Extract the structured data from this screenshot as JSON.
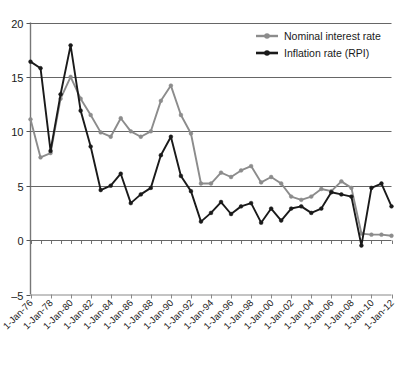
{
  "chart_data": {
    "type": "line",
    "title": "",
    "subtitle": "",
    "xlabel": "",
    "ylabel": "",
    "ylim": [
      -5,
      20
    ],
    "yticks": [
      -5,
      0,
      5,
      10,
      15,
      20
    ],
    "ytick_labels": [
      "–5",
      "0",
      "5",
      "10",
      "15",
      "20"
    ],
    "grid": "horizontal",
    "legend_position": "top-right",
    "x": [
      "1-Jan-76",
      "1-Jan-77",
      "1-Jan-78",
      "1-Jan-79",
      "1-Jan-80",
      "1-Jan-81",
      "1-Jan-82",
      "1-Jan-83",
      "1-Jan-84",
      "1-Jan-85",
      "1-Jan-86",
      "1-Jan-87",
      "1-Jan-88",
      "1-Jan-89",
      "1-Jan-90",
      "1-Jan-91",
      "1-Jan-92",
      "1-Jan-93",
      "1-Jan-94",
      "1-Jan-95",
      "1-Jan-96",
      "1-Jan-97",
      "1-Jan-98",
      "1-Jan-99",
      "1-Jan-00",
      "1-Jan-01",
      "1-Jan-02",
      "1-Jan-03",
      "1-Jan-04",
      "1-Jan-05",
      "1-Jan-06",
      "1-Jan-07",
      "1-Jan-08",
      "1-Jan-09",
      "1-Jan-10",
      "1-Jan-11",
      "1-Jan-12"
    ],
    "xtick_labels": [
      "1-Jan-76",
      "1-Jan-78",
      "1-Jan-80",
      "1-Jan-82",
      "1-Jan-84",
      "1-Jan-86",
      "1-Jan-88",
      "1-Jan-90",
      "1-Jan-92",
      "1-Jan-94",
      "1-Jan-96",
      "1-Jan-98",
      "1-Jan-00",
      "1-Jan-02",
      "1-Jan-04",
      "1-Jan-06",
      "1-Jan-08",
      "1-Jan-10",
      "1-Jan-12"
    ],
    "xtick_indices": [
      0,
      2,
      4,
      6,
      8,
      10,
      12,
      14,
      16,
      18,
      20,
      22,
      24,
      26,
      28,
      30,
      32,
      34,
      36
    ],
    "series": [
      {
        "name": "Nominal interest rate",
        "color": "#8c8c8c",
        "marker": "circle",
        "values": [
          11.1,
          7.6,
          8.0,
          13.0,
          15.0,
          13.0,
          11.5,
          9.9,
          9.5,
          11.2,
          10.0,
          9.5,
          10.0,
          12.8,
          14.2,
          11.5,
          9.8,
          5.2,
          5.2,
          6.2,
          5.8,
          6.4,
          6.8,
          5.3,
          5.8,
          5.2,
          4.0,
          3.7,
          4.0,
          4.7,
          4.5,
          5.4,
          4.8,
          0.6,
          0.5,
          0.5,
          0.4
        ]
      },
      {
        "name": "Inflation rate (RPI)",
        "color": "#1a1a1a",
        "marker": "circle",
        "values": [
          16.4,
          15.8,
          8.2,
          13.4,
          17.9,
          11.9,
          8.6,
          4.6,
          5.0,
          6.1,
          3.4,
          4.2,
          4.8,
          7.8,
          9.5,
          5.9,
          4.5,
          1.7,
          2.5,
          3.5,
          2.4,
          3.1,
          3.4,
          1.6,
          2.9,
          1.8,
          2.9,
          3.1,
          2.5,
          2.9,
          4.4,
          4.2,
          4.0,
          -0.5,
          4.8,
          5.2,
          3.1
        ]
      }
    ]
  },
  "legend": {
    "items": [
      {
        "label": "Nominal interest rate"
      },
      {
        "label": "Inflation rate (RPI)"
      }
    ]
  }
}
